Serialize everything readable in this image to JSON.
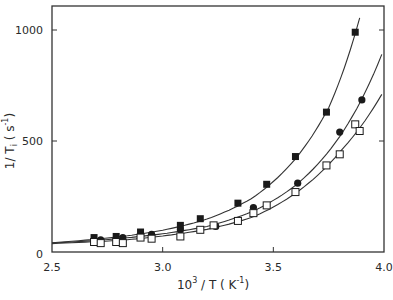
{
  "chart_data": {
    "type": "scatter",
    "title": "",
    "xlabel": "10^3 / T (K^-1)",
    "ylabel": "1/T_i (s^-1)",
    "xlim": [
      2.5,
      4.0
    ],
    "ylim": [
      0,
      1100
    ],
    "x_ticks": [
      2.5,
      3.0,
      3.5,
      4.0
    ],
    "x_tick_labels": [
      "2.5",
      "3.0",
      "3.5",
      "4.0"
    ],
    "y_ticks": [
      0,
      500,
      1000
    ],
    "y_tick_labels": [
      "0",
      "500",
      "1000"
    ],
    "grid": false,
    "legend": null,
    "series": [
      {
        "name": "filled squares",
        "marker": "filled-square",
        "x": [
          2.69,
          2.79,
          2.9,
          3.08,
          3.17,
          3.34,
          3.47,
          3.6,
          3.74,
          3.87
        ],
        "y": [
          65,
          70,
          90,
          120,
          150,
          220,
          305,
          430,
          630,
          990
        ],
        "fit_curve": {
          "x": [
            2.5,
            2.8,
            3.0,
            3.2,
            3.4,
            3.6,
            3.75,
            3.89
          ],
          "y": [
            42,
            68,
            98,
            148,
            240,
            420,
            650,
            1055
          ]
        }
      },
      {
        "name": "filled circles",
        "marker": "filled-circle",
        "x": [
          2.72,
          2.82,
          2.95,
          3.08,
          3.24,
          3.41,
          3.61,
          3.8,
          3.9
        ],
        "y": [
          55,
          65,
          80,
          100,
          115,
          200,
          310,
          540,
          685
        ],
        "fit_curve": {
          "x": [
            2.5,
            2.8,
            3.0,
            3.2,
            3.4,
            3.6,
            3.8,
            3.99
          ],
          "y": [
            40,
            60,
            82,
            115,
            180,
            300,
            520,
            890
          ]
        }
      },
      {
        "name": "open squares",
        "marker": "open-square",
        "x": [
          2.69,
          2.72,
          2.79,
          2.82,
          2.9,
          2.95,
          3.08,
          3.17,
          3.23,
          3.34,
          3.41,
          3.47,
          3.6,
          3.74,
          3.8,
          3.87,
          3.89
        ],
        "y": [
          45,
          40,
          45,
          40,
          65,
          60,
          70,
          100,
          120,
          140,
          175,
          210,
          270,
          390,
          440,
          575,
          545
        ],
        "fit_curve": {
          "x": [
            2.5,
            2.8,
            3.0,
            3.2,
            3.4,
            3.6,
            3.8,
            3.99
          ],
          "y": [
            38,
            52,
            72,
            102,
            155,
            265,
            450,
            710
          ]
        }
      }
    ]
  },
  "axes": {
    "x_label_main": "10",
    "x_label_sup": "3",
    "x_label_mid": " / T ( K",
    "x_label_sup2": "-1",
    "x_label_end": ")",
    "y_label_main": "1/ T",
    "y_label_sub": "i",
    "y_label_mid": " ( s",
    "y_label_sup": "-1",
    "y_label_end": ")"
  }
}
